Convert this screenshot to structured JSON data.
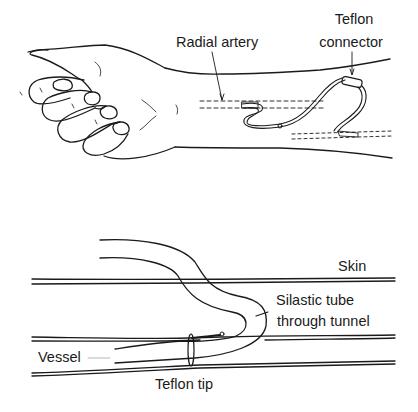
{
  "diagram": {
    "top_panel": {
      "subject": "forearm-and-hand",
      "labels": {
        "radial_artery": "Radial artery",
        "teflon_connector_line1": "Teflon",
        "teflon_connector_line2": "connector"
      }
    },
    "bottom_panel": {
      "subject": "cross-section",
      "labels": {
        "skin": "Skin",
        "silastic_line1": "Silastic tube",
        "silastic_line2": "through tunnel",
        "vessel": "Vessel",
        "teflon_tip": "Teflon tip"
      }
    },
    "colors": {
      "ink": "#1a1a1a",
      "background": "#ffffff"
    }
  }
}
